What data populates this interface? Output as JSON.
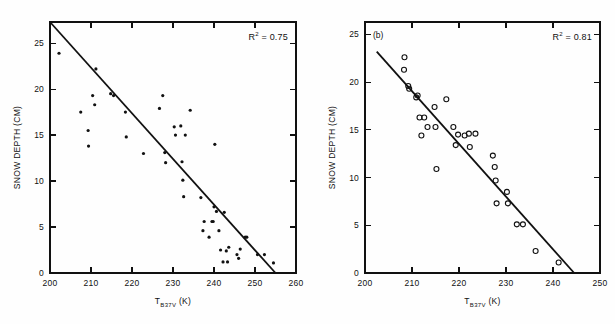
{
  "figure": {
    "background_color": "#fefefe",
    "ink_color": "#111111"
  },
  "chart_data": [
    {
      "id": "panel-a",
      "type": "scatter",
      "title": "",
      "panel_label": "",
      "xlabel_main": "T",
      "xlabel_sub": "B37V",
      "xlabel_unit": " (K)",
      "ylabel": "SNOW DEPTH (CM)",
      "xlim": [
        200,
        260
      ],
      "ylim": [
        0,
        27.3
      ],
      "xticks": [
        200,
        210,
        220,
        230,
        240,
        250,
        260
      ],
      "xticklabels": [
        "200",
        "210",
        "220",
        "230",
        "240",
        "250",
        "260"
      ],
      "yticks": [
        0,
        5,
        10,
        15,
        20,
        25
      ],
      "yticklabels": [
        "0",
        "5",
        "10",
        "15",
        "20",
        "25"
      ],
      "grid": false,
      "marker": "filled-circle",
      "annotation": "R",
      "annotation_sup": "2",
      "annotation_tail": " = 0.75",
      "r_squared": 0.75,
      "fit_line": {
        "x1": 200.0,
        "y1": 27.3,
        "x2": 255.0,
        "y2": 0.0
      },
      "x": [
        202.2,
        207.5,
        209.3,
        209.4,
        210.4,
        210.9,
        211.2,
        214.8,
        215.5,
        218.4,
        218.6,
        222.8,
        226.7,
        227.5,
        228.0,
        228.2,
        230.3,
        230.6,
        231.9,
        232.2,
        232.4,
        232.6,
        233.0,
        234.2,
        236.8,
        237.3,
        237.6,
        238.8,
        239.5,
        239.8,
        240.0,
        240.2,
        240.6,
        241.2,
        241.6,
        242.2,
        242.5,
        243.0,
        243.3,
        243.6,
        245.6,
        246.0,
        246.4,
        247.6,
        248.0,
        250.6,
        252.3,
        254.5
      ],
      "y": [
        23.9,
        17.5,
        15.5,
        13.8,
        19.3,
        18.3,
        22.2,
        19.5,
        19.3,
        17.5,
        14.8,
        13.0,
        17.9,
        19.3,
        13.1,
        12.0,
        15.9,
        15.0,
        16.0,
        12.1,
        10.1,
        8.3,
        15.0,
        17.7,
        8.2,
        4.6,
        5.6,
        3.9,
        5.6,
        5.6,
        7.2,
        14.0,
        6.7,
        4.6,
        2.5,
        1.2,
        6.6,
        2.4,
        1.2,
        2.8,
        2.0,
        1.6,
        2.6,
        3.9,
        3.9,
        2.0,
        2.0,
        1.1
      ]
    },
    {
      "id": "panel-b",
      "type": "scatter",
      "title": "",
      "panel_label": "(b)",
      "xlabel_main": "T",
      "xlabel_sub": "B37V",
      "xlabel_unit": " (K)",
      "ylabel": "SNOW DEPTH (CM)",
      "xlim": [
        200,
        250
      ],
      "ylim": [
        0,
        26.3
      ],
      "xticks": [
        200,
        210,
        220,
        230,
        240,
        250
      ],
      "xticklabels": [
        "200",
        "210",
        "220",
        "230",
        "240",
        "250"
      ],
      "yticks": [
        0,
        5,
        10,
        15,
        20,
        25
      ],
      "yticklabels": [
        "0",
        "5",
        "10",
        "15",
        "20",
        "25"
      ],
      "grid": false,
      "marker": "open-circle",
      "annotation": "R",
      "annotation_sup": "2",
      "annotation_tail": " = 0.81",
      "r_squared": 0.81,
      "fit_line": {
        "x1": 202.5,
        "y1": 23.2,
        "x2": 244.5,
        "y2": 0.0
      },
      "x": [
        208.4,
        208.3,
        209.2,
        209.4,
        210.9,
        211.2,
        211.6,
        212.0,
        212.6,
        213.3,
        214.8,
        215.0,
        215.2,
        217.3,
        218.8,
        219.3,
        219.8,
        221.2,
        222.1,
        222.3,
        223.5,
        227.2,
        227.6,
        227.8,
        228.0,
        230.2,
        230.4,
        232.3,
        233.6,
        236.3,
        241.2
      ],
      "y": [
        22.6,
        21.3,
        19.6,
        19.3,
        18.4,
        18.6,
        16.3,
        14.4,
        16.3,
        15.3,
        17.4,
        15.3,
        10.9,
        18.2,
        15.3,
        13.4,
        14.5,
        14.4,
        14.6,
        13.2,
        14.6,
        12.3,
        11.1,
        9.7,
        7.3,
        8.5,
        7.3,
        5.1,
        5.1,
        2.3,
        1.1
      ]
    }
  ]
}
